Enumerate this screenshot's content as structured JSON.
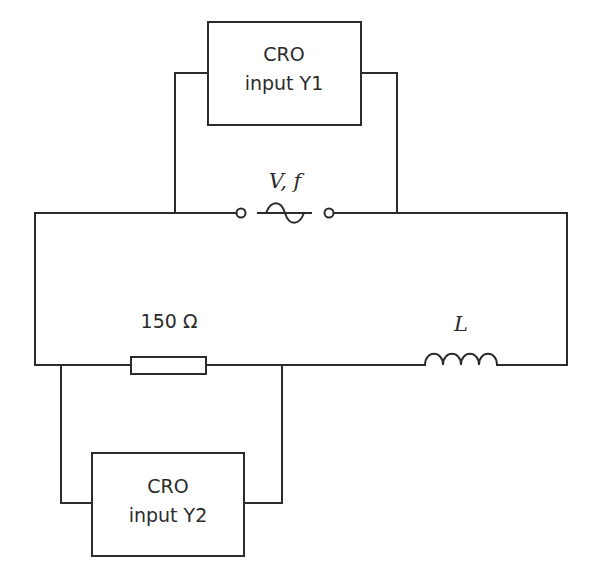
{
  "diagram": {
    "type": "circuit",
    "components": {
      "source": {
        "label": "V, f",
        "symbol": "ac-voltage-source"
      },
      "resistor": {
        "label": "150 Ω",
        "value_ohms": 150
      },
      "inductor": {
        "label": "L"
      },
      "cro_top": {
        "line1": "CRO",
        "line2": "input Y1"
      },
      "cro_bottom": {
        "line1": "CRO",
        "line2": "input Y2"
      }
    },
    "connections": [
      "CRO input Y1 connected across AC source V, f",
      "CRO input Y2 connected across 150 Ω resistor",
      "Source, resistor and inductor L in series loop"
    ],
    "colors": {
      "stroke": "#2b2b2b",
      "background": "#ffffff"
    }
  }
}
